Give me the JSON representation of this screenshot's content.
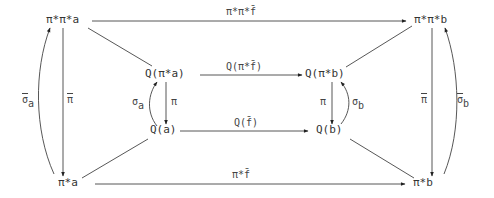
{
  "diagram": {
    "type": "commutative-diagram",
    "nodes": {
      "pp_a": "π*π*a",
      "pp_b": "π*π*b",
      "Q_pa": "Q(π*a)",
      "Q_pb": "Q(π*b)",
      "Q_a": "Q(a)",
      "Q_b": "Q(b)",
      "p_a": "π*a",
      "p_b": "π*b"
    },
    "edge_labels": {
      "top": "π*π*f̄",
      "bottom": "π*f̄",
      "inner_top": "Q(π*f̄)",
      "inner_bottom": "Q(f̄)",
      "left_sigma_main": "σ",
      "left_sigma_sub": "a",
      "left_pi": "π",
      "right_sigma_main": "σ",
      "right_sigma_sub": "b",
      "right_pi": "π",
      "inner_left_sigma_main": "σ",
      "inner_left_sigma_sub": "a",
      "inner_left_pi": "π",
      "inner_right_sigma_main": "σ",
      "inner_right_sigma_sub": "b",
      "inner_right_pi": "π"
    },
    "edges": [
      {
        "from": "π*π*a",
        "to": "π*π*b",
        "label": "π*π*f̄"
      },
      {
        "from": "π*a",
        "to": "π*b",
        "label": "π*f̄"
      },
      {
        "from": "Q(π*a)",
        "to": "Q(π*b)",
        "label": "Q(π*f̄)"
      },
      {
        "from": "Q(a)",
        "to": "Q(b)",
        "label": "Q(f̄)"
      },
      {
        "from": "π*π*a",
        "to": "π*a",
        "label": "π̄"
      },
      {
        "from": "π*a",
        "to": "π*π*a",
        "label": "σ̄_a"
      },
      {
        "from": "π*π*b",
        "to": "π*b",
        "label": "π̄"
      },
      {
        "from": "π*b",
        "to": "π*π*b",
        "label": "σ̄_b"
      },
      {
        "from": "Q(π*a)",
        "to": "Q(a)",
        "label": "π"
      },
      {
        "from": "Q(a)",
        "to": "Q(π*a)",
        "label": "σ_a"
      },
      {
        "from": "Q(π*b)",
        "to": "Q(b)",
        "label": "π"
      },
      {
        "from": "Q(b)",
        "to": "Q(π*b)",
        "label": "σ_b"
      },
      {
        "from": "π*π*a",
        "to": "Q(π*a)",
        "label": ""
      },
      {
        "from": "π*π*b",
        "to": "Q(π*b)",
        "label": ""
      },
      {
        "from": "Q(a)",
        "to": "π*a",
        "label": ""
      },
      {
        "from": "Q(b)",
        "to": "π*b",
        "label": ""
      }
    ]
  }
}
